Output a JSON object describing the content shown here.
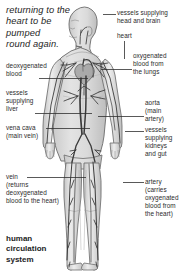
{
  "diagram": {
    "title": "human\ncirculation\nsystem",
    "intro_note": "returning to the\nheart to be\npumped\nround again.",
    "colors": {
      "ink": "#2c2c2c",
      "body_fill": "#d7d7d7",
      "body_outline": "#6e6e6e",
      "vessel": "#3a3a3a",
      "background": "#ffffff"
    },
    "labels_right": [
      {
        "id": "vessels-head-brain",
        "text": "vessels supplying\nhead and brain",
        "x": 117,
        "y": 9,
        "leader": {
          "x1": 116,
          "y1": 14,
          "x2": 103,
          "y2": 14
        }
      },
      {
        "id": "heart",
        "text": "heart",
        "x": 117,
        "y": 32,
        "leader": {
          "x1": 124,
          "y1": 41,
          "x2": 124,
          "y2": 59
        }
      },
      {
        "id": "oxygenated-blood-lungs",
        "text": "oxygenated\nblood from\nthe lungs",
        "x": 133,
        "y": 52,
        "leader": {
          "x1": 132,
          "y1": 69,
          "x2": 101,
          "y2": 69
        }
      },
      {
        "id": "aorta",
        "text": "aorta\n(main\nartery)",
        "x": 145,
        "y": 99,
        "leader": {
          "x1": 144,
          "y1": 116,
          "x2": 98,
          "y2": 116
        }
      },
      {
        "id": "vessels-kidneys-gut",
        "text": "vessels\nsupplying\nkidneys\nand gut",
        "x": 145,
        "y": 126,
        "leader": {
          "x1": 144,
          "y1": 131,
          "x2": 125,
          "y2": 131
        }
      },
      {
        "id": "artery",
        "text": "artery\n(carries\noxygenated\nblood from\nthe heart)",
        "x": 145,
        "y": 178,
        "leader": {
          "x1": 144,
          "y1": 182,
          "x2": 123,
          "y2": 182
        }
      }
    ],
    "labels_left": [
      {
        "id": "deoxygenated-blood",
        "text": "deoxygenated\nblood",
        "x": 6,
        "y": 62,
        "leader": {
          "x1": 39,
          "y1": 78,
          "x2": 88,
          "y2": 78
        }
      },
      {
        "id": "vessels-liver",
        "text": "vessels\nsupplying\nliver",
        "x": 6,
        "y": 89,
        "leader": {
          "x1": 35,
          "y1": 113,
          "x2": 92,
          "y2": 113
        }
      },
      {
        "id": "vena-cava",
        "text": "vena cava\n(main vein)",
        "x": 6,
        "y": 124,
        "leader": {
          "x1": 46,
          "y1": 128,
          "x2": 90,
          "y2": 128
        }
      },
      {
        "id": "vein",
        "text": "vein\n(returns\ndeoxygenated\nblood to the heart)",
        "x": 6,
        "y": 173,
        "leader": {
          "x1": 27,
          "y1": 177,
          "x2": 86,
          "y2": 177
        }
      }
    ],
    "title_position": {
      "x": 6,
      "y": 234
    }
  }
}
